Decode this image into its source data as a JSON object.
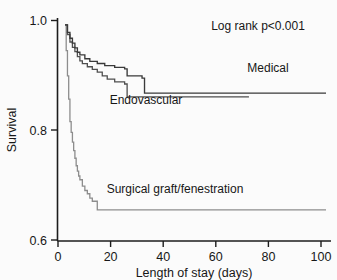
{
  "figure": {
    "background": "#fbfbfb",
    "ink_color": "#1c1c1c"
  },
  "chart_data": {
    "type": "line",
    "subtype": "kaplan-meier-survival-step",
    "title": "",
    "xlabel": "Length of stay (days)",
    "ylabel": "Survival",
    "xlim": [
      -3,
      107
    ],
    "ylim": [
      0.6,
      1.008
    ],
    "xticks": [
      0,
      20,
      40,
      60,
      80,
      100
    ],
    "xticklabels": [
      "0",
      "20",
      "40",
      "60",
      "80",
      "100"
    ],
    "yticks": [
      0.6,
      0.8,
      1.0
    ],
    "yticklabels": [
      "0.6",
      "0.8",
      "1.0"
    ],
    "grid": false,
    "legend_position": "inline-curve-labels",
    "annotations": [
      {
        "name": "log-rank-annotation",
        "text": "Log rank p<0.001",
        "x": 72,
        "y": 0.985
      }
    ],
    "series": [
      {
        "name": "Medical",
        "color": "#3a3a3a",
        "label_x": 80,
        "label_y": 0.895,
        "step": "post",
        "points": [
          [
            0,
            1.0
          ],
          [
            1,
            0.986
          ],
          [
            2,
            0.975
          ],
          [
            3,
            0.966
          ],
          [
            4,
            0.957
          ],
          [
            5,
            0.949
          ],
          [
            6,
            0.944
          ],
          [
            8,
            0.937
          ],
          [
            10,
            0.932
          ],
          [
            13,
            0.928
          ],
          [
            16,
            0.924
          ],
          [
            20,
            0.921
          ],
          [
            24,
            0.918
          ],
          [
            25,
            0.905
          ],
          [
            31,
            0.901
          ],
          [
            32,
            0.873
          ],
          [
            105,
            0.873
          ]
        ]
      },
      {
        "name": "Endovascular",
        "color": "#4f4f4f",
        "label_x": 26,
        "label_y": 0.843,
        "step": "post",
        "points": [
          [
            0,
            1.0
          ],
          [
            1,
            0.982
          ],
          [
            2,
            0.968
          ],
          [
            3,
            0.958
          ],
          [
            4,
            0.95
          ],
          [
            5,
            0.941
          ],
          [
            6,
            0.933
          ],
          [
            7,
            0.928
          ],
          [
            9,
            0.922
          ],
          [
            11,
            0.917
          ],
          [
            13,
            0.912
          ],
          [
            15,
            0.905
          ],
          [
            17,
            0.899
          ],
          [
            20,
            0.894
          ],
          [
            24,
            0.89
          ],
          [
            25,
            0.866
          ],
          [
            74,
            0.866
          ]
        ]
      },
      {
        "name": "Surgical graft/fenestration",
        "color": "#8d8d8d",
        "label_x": 28,
        "label_y": 0.69,
        "step": "post",
        "points": [
          [
            0,
            1.0
          ],
          [
            0.5,
            0.952
          ],
          [
            1,
            0.905
          ],
          [
            1.5,
            0.862
          ],
          [
            2,
            0.82
          ],
          [
            2.5,
            0.8
          ],
          [
            3,
            0.782
          ],
          [
            3.5,
            0.766
          ],
          [
            4,
            0.752
          ],
          [
            4.5,
            0.738
          ],
          [
            5,
            0.728
          ],
          [
            5.5,
            0.719
          ],
          [
            6,
            0.712
          ],
          [
            7,
            0.7
          ],
          [
            8,
            0.692
          ],
          [
            9,
            0.686
          ],
          [
            10,
            0.678
          ],
          [
            11,
            0.672
          ],
          [
            13,
            0.656
          ],
          [
            105,
            0.656
          ]
        ]
      }
    ]
  }
}
